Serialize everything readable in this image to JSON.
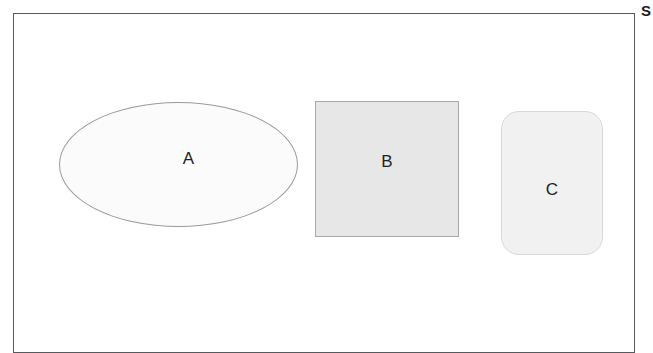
{
  "figure": {
    "background_color": "#ffffff",
    "frame": {
      "name": "diagram-border",
      "border_color": "#555a5e",
      "fill_color": "#ffffff"
    },
    "side_caption": {
      "text": "S",
      "note": "clipped caption glyph at right margin"
    },
    "shapes": [
      {
        "id": "a",
        "label": "A",
        "type": "ellipse",
        "fill_color": "#fbfbfb",
        "stroke_color": "#9b9b9b"
      },
      {
        "id": "b",
        "label": "B",
        "type": "square",
        "fill_color": "#e7e7e7",
        "stroke_color": "#a9a9a9"
      },
      {
        "id": "c",
        "label": "C",
        "type": "rounded-rectangle",
        "fill_color": "#f1f1f1",
        "stroke_color": "#d8d8d8"
      }
    ]
  }
}
